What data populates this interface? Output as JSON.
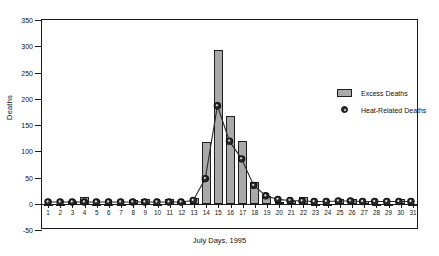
{
  "chart_data": {
    "type": "bar",
    "title": "",
    "xlabel": "July Days, 1995",
    "ylabel": "Deaths",
    "categories": [
      "1",
      "2",
      "3",
      "4",
      "5",
      "6",
      "7",
      "8",
      "9",
      "10",
      "11",
      "12",
      "13",
      "14",
      "15",
      "16",
      "17",
      "18",
      "19",
      "20",
      "21",
      "22",
      "23",
      "24",
      "25",
      "26",
      "27",
      "28",
      "29",
      "30",
      "31"
    ],
    "ylim": [
      -50,
      350
    ],
    "yticks": [
      -50,
      0,
      50,
      100,
      150,
      200,
      250,
      300,
      350
    ],
    "grid": false,
    "legend_position": "upper right",
    "series": [
      {
        "name": "Excess Deaths",
        "type": "bar",
        "color": "#a9a9a9",
        "values": [
          -4,
          -3,
          6,
          12,
          -2,
          -3,
          -2,
          8,
          10,
          -2,
          9,
          6,
          11,
          118,
          293,
          167,
          120,
          41,
          15,
          4,
          6,
          12,
          -3,
          -2,
          9,
          10,
          6,
          -2,
          -3,
          9,
          -4
        ]
      },
      {
        "name": "Heat-Related Deaths",
        "type": "line",
        "color": "#2b2b2b",
        "values": [
          0,
          0,
          0,
          0,
          0,
          0,
          0,
          0,
          0,
          0,
          0,
          0,
          3,
          45,
          185,
          117,
          83,
          32,
          12,
          5,
          3,
          2,
          1,
          1,
          2,
          2,
          1,
          1,
          1,
          1,
          1
        ]
      }
    ]
  },
  "legend": {
    "items": [
      {
        "label": "Excess Deaths",
        "marker": "bar-swatch"
      },
      {
        "label": "Heat-Related Deaths",
        "marker": "circle-marker"
      }
    ]
  },
  "axes": {
    "y_title": "Deaths",
    "x_title": "July Days, 1995"
  },
  "colors": {
    "bar_fill": "#a9a9a9",
    "bar_stroke": "#1f1f1f",
    "line": "#2b2b2b",
    "frame": "#1a1a1a",
    "background": "#ffffff"
  }
}
